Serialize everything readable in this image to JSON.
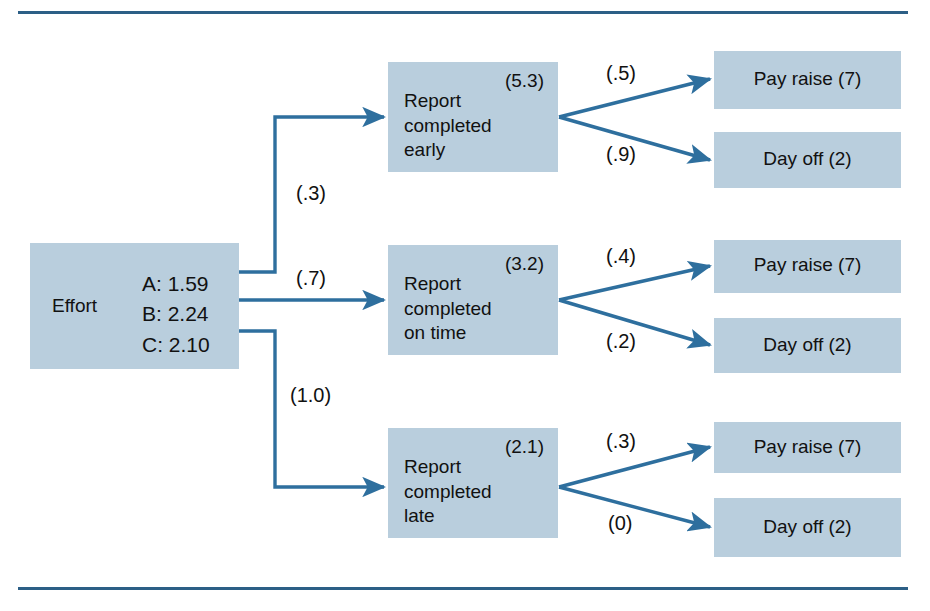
{
  "figure": {
    "accent_line_color": "#2c5f86",
    "node_fill_color": "#b9cedd",
    "arrow_color": "#2e6f9e",
    "text_color": "#111111"
  },
  "effort": {
    "name": "Effort",
    "values": [
      "A: 1.59",
      "B: 2.24",
      "C: 2.10"
    ]
  },
  "performance": [
    {
      "text": "Report\ncompleted\nearly",
      "value": "(5.3)",
      "expectancy": "(.3)"
    },
    {
      "text": "Report\ncompleted\non time",
      "value": "(3.2)",
      "expectancy": "(.7)"
    },
    {
      "text": "Report\ncompleted\nlate",
      "value": "(2.1)",
      "expectancy": "(1.0)"
    }
  ],
  "outcomes": [
    {
      "text": "Pay raise (7)",
      "instrumentality": "(.5)"
    },
    {
      "text": "Day off (2)",
      "instrumentality": "(.9)"
    },
    {
      "text": "Pay raise (7)",
      "instrumentality": "(.4)"
    },
    {
      "text": "Day off (2)",
      "instrumentality": "(.2)"
    },
    {
      "text": "Pay raise (7)",
      "instrumentality": "(.3)"
    },
    {
      "text": "Day off (2)",
      "instrumentality": "(0)"
    }
  ]
}
